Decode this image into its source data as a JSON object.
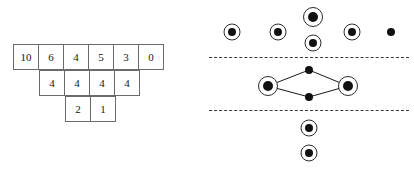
{
  "figure": {
    "background_color": "#ffffff",
    "ink_color": "#111111",
    "cell_border_color": "#6b6b6b",
    "separator_color": "#3a3a3a"
  },
  "left_panel": {
    "name": "staircase-number-table",
    "cell_size_px": 26,
    "origin": {
      "x": 14,
      "y": 45
    },
    "rows": [
      {
        "indent_cells": 0,
        "values": [
          "10",
          "6",
          "4",
          "5",
          "3",
          "0"
        ]
      },
      {
        "indent_cells": 1,
        "values": [
          "4",
          "4",
          "4",
          "4"
        ]
      },
      {
        "indent_cells": 2,
        "values": [
          "2",
          "1"
        ]
      }
    ]
  },
  "right_panel": {
    "name": "dot-configuration-diagram",
    "separators": [
      {
        "label": "upper-separator",
        "y": 57
      },
      {
        "label": "lower-separator",
        "y": 110
      }
    ],
    "sections": [
      {
        "label": "top-section",
        "nodes": [
          {
            "id": "t1",
            "style": "ringed",
            "cx": 27,
            "cy": 32,
            "size": "normal"
          },
          {
            "id": "t2",
            "style": "ringed",
            "cx": 73,
            "cy": 32,
            "size": "normal"
          },
          {
            "id": "t3",
            "style": "ringed",
            "cx": 108,
            "cy": 17,
            "size": "big"
          },
          {
            "id": "t4",
            "style": "ringed",
            "cx": 108,
            "cy": 43,
            "size": "normal"
          },
          {
            "id": "t5",
            "style": "ringed",
            "cx": 147,
            "cy": 32,
            "size": "normal"
          },
          {
            "id": "t6",
            "style": "plain",
            "cx": 186,
            "cy": 32,
            "size": "normal"
          }
        ],
        "edges": []
      },
      {
        "label": "middle-section",
        "nodes": [
          {
            "id": "m-left",
            "style": "ringed",
            "cx": 63,
            "cy": 86,
            "size": "big"
          },
          {
            "id": "m-top",
            "style": "plain",
            "cx": 104,
            "cy": 70,
            "size": "normal"
          },
          {
            "id": "m-bottom",
            "style": "plain",
            "cx": 104,
            "cy": 97,
            "size": "normal"
          },
          {
            "id": "m-right",
            "style": "ringed",
            "cx": 143,
            "cy": 86,
            "size": "big"
          }
        ],
        "edges": [
          {
            "from": "m-left",
            "to": "m-top"
          },
          {
            "from": "m-top",
            "to": "m-right"
          },
          {
            "from": "m-left",
            "to": "m-bottom"
          },
          {
            "from": "m-bottom",
            "to": "m-right"
          }
        ]
      },
      {
        "label": "bottom-section",
        "nodes": [
          {
            "id": "b1",
            "style": "ringed",
            "cx": 104,
            "cy": 128,
            "size": "normal"
          },
          {
            "id": "b2",
            "style": "ringed",
            "cx": 104,
            "cy": 153,
            "size": "normal"
          }
        ],
        "edges": []
      }
    ],
    "edge_endpoints": [
      {
        "x1": 63,
        "y1": 86,
        "x2": 104,
        "y2": 70
      },
      {
        "x1": 104,
        "y1": 70,
        "x2": 143,
        "y2": 86
      },
      {
        "x1": 63,
        "y1": 86,
        "x2": 104,
        "y2": 97
      },
      {
        "x1": 104,
        "y1": 97,
        "x2": 143,
        "y2": 86
      }
    ]
  }
}
